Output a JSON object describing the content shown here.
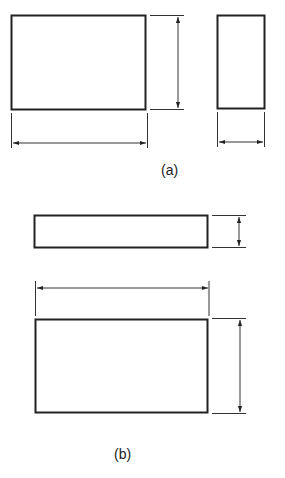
{
  "figure": {
    "stroke_color": "#222222",
    "line_color": "#333333",
    "background": "#ffffff",
    "parts": [
      {
        "label": "(a)",
        "views": [
          {
            "name": "front-view",
            "rect": {
              "x": 11,
              "y": 15,
              "w": 135,
              "h": 95
            },
            "dims": [
              "width",
              "height"
            ]
          },
          {
            "name": "side-view",
            "rect": {
              "x": 217,
              "y": 15,
              "w": 48,
              "h": 94
            },
            "dims": [
              "width"
            ]
          }
        ]
      },
      {
        "label": "(b)",
        "views": [
          {
            "name": "top-view",
            "rect": {
              "x": 34,
              "y": 215,
              "w": 174,
              "h": 33
            },
            "dims": [
              "height"
            ]
          },
          {
            "name": "front-view",
            "rect": {
              "x": 35,
              "y": 319,
              "w": 173,
              "h": 94
            },
            "dims": [
              "width",
              "height"
            ]
          }
        ]
      }
    ]
  }
}
